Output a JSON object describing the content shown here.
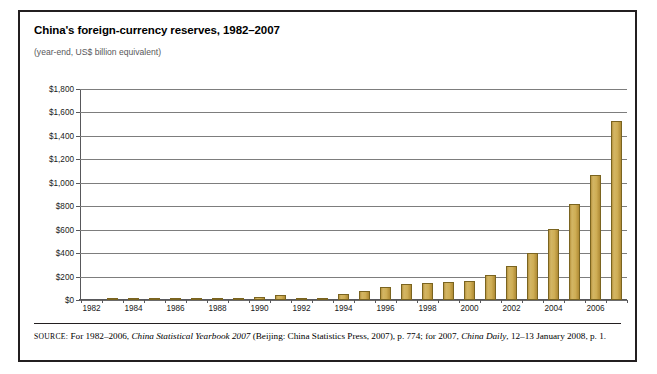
{
  "figure": {
    "title": "China's foreign-currency reserves, 1982–2007",
    "subtitle": "(year-end, US$ billion equivalent)"
  },
  "source": {
    "label": "SOURCE:",
    "part1": " For 1982–2006, ",
    "italic1": "China Statistical Yearbook 2007",
    "part2": " (Beijing: China Statistics Press, 2007), p. 774; for 2007, ",
    "italic2": "China Daily",
    "part3": ", 12–13 January 2008, p. 1."
  },
  "colors": {
    "bar_fill": "#c9a84c",
    "bar_border": "#7a6420",
    "gridline": "#7d7d7d",
    "axis": "#58585b",
    "frame": "#231f20",
    "title_text": "#000000",
    "subtitle_text": "#58585b"
  },
  "chart_data": {
    "type": "bar",
    "title": "China's foreign-currency reserves, 1982–2007",
    "subtitle": "(year-end, US$ billion equivalent)",
    "xlabel": "",
    "ylabel": "US$ billion equivalent",
    "ylim": [
      0,
      1800
    ],
    "ytick_step": 200,
    "ytick_labels": [
      "$0",
      "$200",
      "$400",
      "$600",
      "$800",
      "$1,000",
      "$1,200",
      "$1,400",
      "$1,600",
      "$1,800"
    ],
    "ytick_values": [
      0,
      200,
      400,
      600,
      800,
      1000,
      1200,
      1400,
      1600,
      1800
    ],
    "xtick_labels": [
      "1982",
      "1984",
      "1986",
      "1988",
      "1990",
      "1992",
      "1994",
      "1996",
      "1998",
      "2000",
      "2002",
      "2004",
      "2006"
    ],
    "xtick_every": 2,
    "grid": true,
    "legend": false,
    "categories": [
      "1982",
      "1983",
      "1984",
      "1985",
      "1986",
      "1987",
      "1988",
      "1989",
      "1990",
      "1991",
      "1992",
      "1993",
      "1994",
      "1995",
      "1996",
      "1997",
      "1998",
      "1999",
      "2000",
      "2001",
      "2002",
      "2003",
      "2004",
      "2005",
      "2006",
      "2007"
    ],
    "values": [
      0,
      9,
      15,
      3,
      2,
      3,
      3,
      6,
      29,
      43,
      20,
      21,
      52,
      74,
      107,
      140,
      145,
      155,
      166,
      212,
      286,
      403,
      610,
      819,
      1066,
      1528
    ]
  }
}
